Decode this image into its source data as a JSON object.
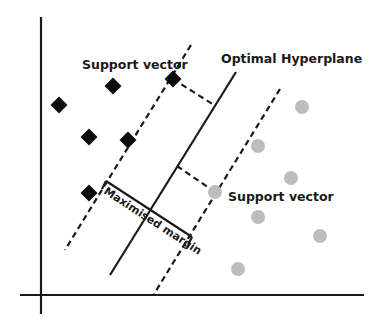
{
  "diagram": {
    "labels": {
      "support_vector_top": "Support vector",
      "optimal_hyperplane": "Optimal Hyperplane",
      "support_vector_right": "Support vector",
      "maximised_margin": "Maximised margin"
    },
    "colors": {
      "class_a": "#0d0d0d",
      "class_b": "#bdbdbd",
      "lines": "#1a1a1a"
    },
    "class_a_points": [
      {
        "x": 59,
        "y": 105
      },
      {
        "x": 113,
        "y": 86
      },
      {
        "x": 89,
        "y": 137
      },
      {
        "x": 128,
        "y": 140
      },
      {
        "x": 173,
        "y": 79
      },
      {
        "x": 89,
        "y": 193
      }
    ],
    "class_b_points": [
      {
        "x": 302,
        "y": 107
      },
      {
        "x": 258,
        "y": 146
      },
      {
        "x": 215,
        "y": 192
      },
      {
        "x": 291,
        "y": 178
      },
      {
        "x": 258,
        "y": 217
      },
      {
        "x": 320,
        "y": 236
      },
      {
        "x": 238,
        "y": 269
      }
    ]
  }
}
